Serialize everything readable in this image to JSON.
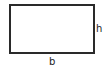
{
  "diagram": {
    "shape": "rectangle",
    "labels": {
      "height": "h",
      "base": "b"
    },
    "stroke_color": "#2a2a2a",
    "background": "#ffffff"
  }
}
